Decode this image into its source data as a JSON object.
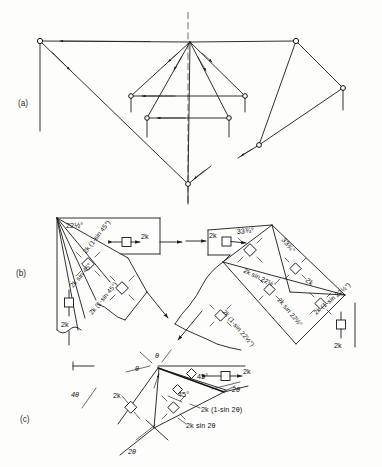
{
  "figure": {
    "background_color": "#fdfdfc",
    "line_color": "#1a1a1a",
    "panels": [
      {
        "id": "a",
        "label": "(a)",
        "x": 18,
        "y": 103
      },
      {
        "id": "b",
        "label": "(b)",
        "x": 16,
        "y": 273
      },
      {
        "id": "c",
        "label": "(c)",
        "x": 20,
        "y": 419
      }
    ]
  },
  "panel_a": {
    "label": "(a)",
    "description": "Velocity hodograph: left straight member, central symmetric fan of five rays to a lower vertex, right triangular linkage",
    "nodes": [
      {
        "name": "left-top-node",
        "x": 40,
        "y": 41
      },
      {
        "name": "apex-node",
        "x": 190,
        "y": 42
      },
      {
        "name": "right-top-node",
        "x": 296,
        "y": 41
      },
      {
        "name": "fan-left-upper-node",
        "x": 131,
        "y": 96
      },
      {
        "name": "fan-right-upper-node",
        "x": 245,
        "y": 96
      },
      {
        "name": "fan-left-lower-node",
        "x": 147,
        "y": 118
      },
      {
        "name": "fan-right-lower-node",
        "x": 229,
        "y": 118
      },
      {
        "name": "bottom-vertex-node",
        "x": 188,
        "y": 184
      },
      {
        "name": "right-lower-node",
        "x": 259,
        "y": 145
      },
      {
        "name": "right-mid-node",
        "x": 343,
        "y": 88
      }
    ],
    "centerline": {
      "name": "vertical-centerline",
      "x": 188,
      "y1": 12,
      "y2": 205,
      "style": "dashed"
    }
  },
  "panel_b": {
    "label": "(b)",
    "left_block": {
      "angles": [
        "22½°"
      ],
      "labels": [
        "2k (1-sin 45°)",
        "2k sin 45°",
        "2k",
        "2k (1-sin 45°)",
        "2k"
      ],
      "angle_label": "22½°",
      "force_top": "2k",
      "force_bottom": "2k",
      "diag_upper": "2k (1-sin 45°)",
      "diag_mid": "2k sin 45°",
      "diag_lower": "2k (1-sin 45°)"
    },
    "right_block": {
      "angle_left": "33¾°",
      "angle_right": "33¾°",
      "force_left": "2k",
      "force_right": "2k",
      "force_bottom": "2k",
      "label_a": "2k sin 22½°",
      "label_b": "2k sin 22½°",
      "label_c": "2k (1-sin 22½°)",
      "label_d": "2k (1-sin 22½°)",
      "label_e": "2k"
    }
  },
  "panel_c": {
    "label": "(c)",
    "angles": {
      "theta_top": "θ",
      "theta_left": "θ",
      "four_theta": "4θ",
      "two_theta_right": "2θ",
      "two_theta_bottom": "2θ",
      "forty_five_upper": "45°",
      "forty_five_lower": "45°"
    },
    "labels": {
      "force_right": "2k",
      "force_left": "2k",
      "expr_one": "2k (1-sin 2θ)",
      "expr_two": "2k sin 2θ"
    }
  }
}
